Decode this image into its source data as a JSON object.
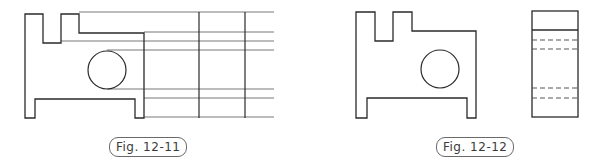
{
  "figures": [
    {
      "id": "fig-12-11",
      "caption": "Fig. 12-11",
      "description": "Front view with horizontal projection lines and two vertical reference lines for constructing the side view"
    },
    {
      "id": "fig-12-12",
      "caption": "Fig. 12-12",
      "description": "Completed front view and side view with hidden (dashed) lines"
    }
  ],
  "colors": {
    "outline": "#2a2a2a",
    "projection": "#555555",
    "hidden": "#555555",
    "background": "#ffffff"
  }
}
